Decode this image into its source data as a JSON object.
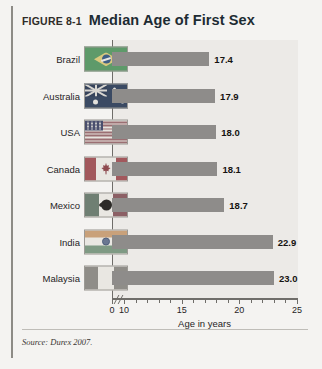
{
  "figure": {
    "number": "FIGURE 8-1",
    "title": "Median Age of First Sex",
    "source": "Source: Durex 2007."
  },
  "chart_data": {
    "type": "bar",
    "orientation": "horizontal",
    "title": "Median Age of First Sex",
    "xlabel": "Age in years",
    "ylabel": "",
    "xlim": [
      0,
      25
    ],
    "axis_break_after": 0,
    "grid": false,
    "legend": "none",
    "xticks": [
      "0",
      "10",
      "15",
      "20",
      "25"
    ],
    "xtick_values": [
      0,
      10,
      15,
      20,
      25
    ],
    "minor_tick_step": 1,
    "bar_color": "#8e8c8a",
    "plot_background": "#eceae7",
    "categories": [
      "Brazil",
      "Australia",
      "USA",
      "Canada",
      "Mexico",
      "India",
      "Malaysia"
    ],
    "values": [
      17.4,
      17.9,
      18.0,
      18.1,
      18.7,
      22.9,
      23.0
    ],
    "value_labels": [
      "17.4",
      "17.9",
      "18.0",
      "18.1",
      "18.7",
      "22.9",
      "23.0"
    ],
    "rows": [
      {
        "category": "Brazil",
        "value": 17.4,
        "label": "17.4",
        "flag": "flag-brazil"
      },
      {
        "category": "Australia",
        "value": 17.9,
        "label": "17.9",
        "flag": "flag-australia"
      },
      {
        "category": "USA",
        "value": 18.0,
        "label": "18.0",
        "flag": "flag-usa"
      },
      {
        "category": "Canada",
        "value": 18.1,
        "label": "18.1",
        "flag": "flag-canada"
      },
      {
        "category": "Mexico",
        "value": 18.7,
        "label": "18.7",
        "flag": "flag-mexico"
      },
      {
        "category": "India",
        "value": 22.9,
        "label": "22.9",
        "flag": "flag-india"
      },
      {
        "category": "Malaysia",
        "value": 23.0,
        "label": "23.0",
        "flag": "flag-malaysia"
      }
    ]
  }
}
